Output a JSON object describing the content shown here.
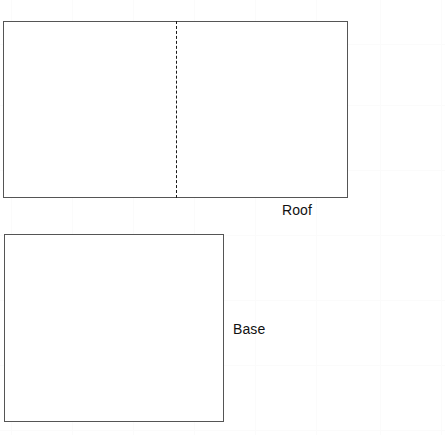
{
  "canvas": {
    "width": 445,
    "height": 435,
    "background_color": "#ffffff",
    "title": "Roof and Base Diagram"
  },
  "style": {
    "outline_color": "#555555",
    "fold_line_color": "#1a1a1a",
    "label_color": "#111111",
    "grid_color": "#fbfbfb",
    "fill_color": "#ffffff"
  },
  "grid": {
    "visible": true,
    "spacing_px": 61,
    "vertical_x": [
      11,
      72,
      133,
      194,
      255,
      316,
      380,
      441
    ],
    "horizontal_y": [
      44,
      105,
      170,
      235,
      300,
      365,
      430
    ]
  },
  "shapes": [
    {
      "id": "roof",
      "label": "Roof",
      "type": "rectangle",
      "x": 3,
      "y": 21,
      "width": 345,
      "height": 177,
      "fill": "#ffffff",
      "stroke": "#555555",
      "stroke_width": 1,
      "fold_line": {
        "present": true,
        "orientation": "vertical",
        "x": 176,
        "y_start": 21,
        "y_end": 198,
        "style": "dashed"
      },
      "label_position": {
        "x": 282,
        "y": 202
      }
    },
    {
      "id": "base",
      "label": "Base",
      "type": "rectangle",
      "x": 4,
      "y": 234,
      "width": 220,
      "height": 188,
      "fill": "#ffffff",
      "stroke": "#555555",
      "stroke_width": 1,
      "fold_line": {
        "present": false
      },
      "label_position": {
        "x": 233,
        "y": 321
      }
    }
  ],
  "labels": {
    "roof": "Roof",
    "base": "Base"
  }
}
